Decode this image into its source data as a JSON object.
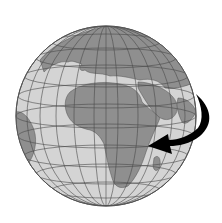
{
  "figure": {
    "view": "Europe, Africa and Middle East",
    "colors": {
      "background": "#ffffff",
      "ocean": "#d4d4d4",
      "land": "#8f8f8f",
      "gridlines": "#4a4a4a",
      "arrow": "#000000"
    },
    "annotation": {
      "type": "curved-arrow",
      "direction": "from right edge toward East Africa"
    }
  }
}
